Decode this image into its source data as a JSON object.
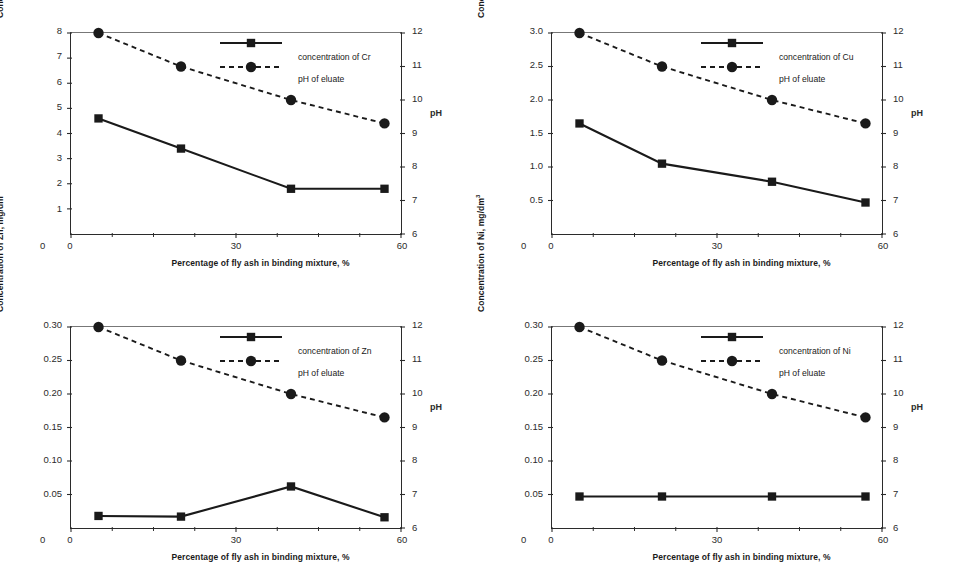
{
  "figure": {
    "panel_count": 4,
    "shared": {
      "xlabel": "Percentage of fly ash in binding mixture, %",
      "x_ticks": [
        "0",
        "30",
        "60"
      ],
      "x_tick_values": [
        0,
        30,
        60
      ],
      "xlim": [
        0,
        60
      ],
      "ph_axis_label": "pH",
      "ph_ticks": [
        "6",
        "7",
        "8",
        "9",
        "10",
        "11",
        "12"
      ],
      "ph_tick_values": [
        6,
        7,
        8,
        9,
        10,
        11,
        12
      ],
      "ph_lim": [
        6,
        12
      ],
      "ph_series_name": "pH of eluate",
      "ph_values": [
        12.0,
        11.0,
        10.0,
        9.3
      ],
      "x_values": [
        5,
        20,
        40,
        57
      ],
      "zero_label": "0",
      "marker_conc": "square",
      "marker_ph": "circle",
      "line_conc": "solid",
      "line_ph": "dashed",
      "color_ink": "#1a1a1a",
      "color_axis": "#2b2b2b"
    }
  },
  "chart_data": [
    {
      "type": "line",
      "title": "",
      "panel": "top-left",
      "element": "Cr",
      "xlabel": "Percentage of fly ash in binding mixture, %",
      "ylabel": "Concentration of Cr, mg/dm",
      "ylabel_sup": "3",
      "x": [
        5,
        20,
        40,
        57
      ],
      "xlim": [
        0,
        60
      ],
      "xticks": [
        "0",
        "30",
        "60"
      ],
      "ylim": [
        0,
        8
      ],
      "yticks": [
        "1",
        "2",
        "3",
        "4",
        "5",
        "6",
        "7",
        "8"
      ],
      "ytick_values": [
        1,
        2,
        3,
        4,
        5,
        6,
        7,
        8
      ],
      "y2label": "pH",
      "y2lim": [
        6,
        12
      ],
      "y2ticks": [
        "6",
        "7",
        "8",
        "9",
        "10",
        "11",
        "12"
      ],
      "grid": false,
      "legend_position": "top-center-right",
      "series": [
        {
          "name": "concentration of Cr",
          "axis": "left",
          "style": "solid",
          "marker": "square",
          "values": [
            4.6,
            3.4,
            1.8,
            1.8
          ]
        },
        {
          "name": "pH of eluate",
          "axis": "right",
          "style": "dashed",
          "marker": "circle",
          "values": [
            12.0,
            11.0,
            10.0,
            9.3
          ]
        }
      ]
    },
    {
      "type": "line",
      "title": "",
      "panel": "top-right",
      "element": "Cu",
      "xlabel": "Percentage of fly ash in binding mixture, %",
      "ylabel": "Concentration of Cu, mg/dm",
      "ylabel_sup": "3",
      "x": [
        5,
        20,
        40,
        57
      ],
      "xlim": [
        0,
        60
      ],
      "xticks": [
        "0",
        "30",
        "60"
      ],
      "ylim": [
        0,
        3.0
      ],
      "yticks": [
        "0.5",
        "1.0",
        "1.5",
        "2.0",
        "2.5",
        "3.0"
      ],
      "ytick_values": [
        0.5,
        1.0,
        1.5,
        2.0,
        2.5,
        3.0
      ],
      "y2label": "pH",
      "y2lim": [
        6,
        12
      ],
      "y2ticks": [
        "6",
        "7",
        "8",
        "9",
        "10",
        "11",
        "12"
      ],
      "grid": false,
      "legend_position": "top-center-right",
      "series": [
        {
          "name": "concentration of Cu",
          "axis": "left",
          "style": "solid",
          "marker": "square",
          "values": [
            1.65,
            1.05,
            0.78,
            0.47
          ]
        },
        {
          "name": "pH of eluate",
          "axis": "right",
          "style": "dashed",
          "marker": "circle",
          "values": [
            12.0,
            11.0,
            10.0,
            9.3
          ]
        }
      ]
    },
    {
      "type": "line",
      "title": "",
      "panel": "bottom-left",
      "element": "Zn",
      "xlabel": "Percentage of fly ash in binding mixture, %",
      "ylabel": "Concentration of Zn, mg/dm",
      "ylabel_sup": "3",
      "x": [
        5,
        20,
        40,
        57
      ],
      "xlim": [
        0,
        60
      ],
      "xticks": [
        "0",
        "30",
        "60"
      ],
      "ylim": [
        0,
        0.3
      ],
      "yticks": [
        "0.05",
        "0.10",
        "0.15",
        "0.20",
        "0.25",
        "0.30"
      ],
      "ytick_values": [
        0.05,
        0.1,
        0.15,
        0.2,
        0.25,
        0.3
      ],
      "y2label": "pH",
      "y2lim": [
        6,
        12
      ],
      "y2ticks": [
        "6",
        "7",
        "8",
        "9",
        "10",
        "11",
        "12"
      ],
      "grid": false,
      "legend_position": "top-center-right",
      "series": [
        {
          "name": "concentration of Zn",
          "axis": "left",
          "style": "solid",
          "marker": "square",
          "values": [
            0.018,
            0.017,
            0.062,
            0.016
          ]
        },
        {
          "name": "pH of eluate",
          "axis": "right",
          "style": "dashed",
          "marker": "circle",
          "values": [
            12.0,
            11.0,
            10.0,
            9.3
          ]
        }
      ]
    },
    {
      "type": "line",
      "title": "",
      "panel": "bottom-right",
      "element": "Ni",
      "xlabel": "Percentage of fly ash in binding mixture, %",
      "ylabel": "Concentration of Ni, mg/dm",
      "ylabel_sup": "3",
      "x": [
        5,
        20,
        40,
        57
      ],
      "xlim": [
        0,
        60
      ],
      "xticks": [
        "0",
        "30",
        "60"
      ],
      "ylim": [
        0,
        0.3
      ],
      "yticks": [
        "0.05",
        "0.10",
        "0.15",
        "0.20",
        "0.25",
        "0.30"
      ],
      "ytick_values": [
        0.05,
        0.1,
        0.15,
        0.2,
        0.25,
        0.3
      ],
      "y2label": "pH",
      "y2lim": [
        6,
        12
      ],
      "y2ticks": [
        "6",
        "7",
        "8",
        "9",
        "10",
        "11",
        "12"
      ],
      "grid": false,
      "legend_position": "top-center-right",
      "series": [
        {
          "name": "concentration of Ni",
          "axis": "left",
          "style": "solid",
          "marker": "square",
          "values": [
            0.047,
            0.047,
            0.047,
            0.047
          ]
        },
        {
          "name": "pH of eluate",
          "axis": "right",
          "style": "dashed",
          "marker": "circle",
          "values": [
            12.0,
            11.0,
            10.0,
            9.3
          ]
        }
      ]
    }
  ]
}
